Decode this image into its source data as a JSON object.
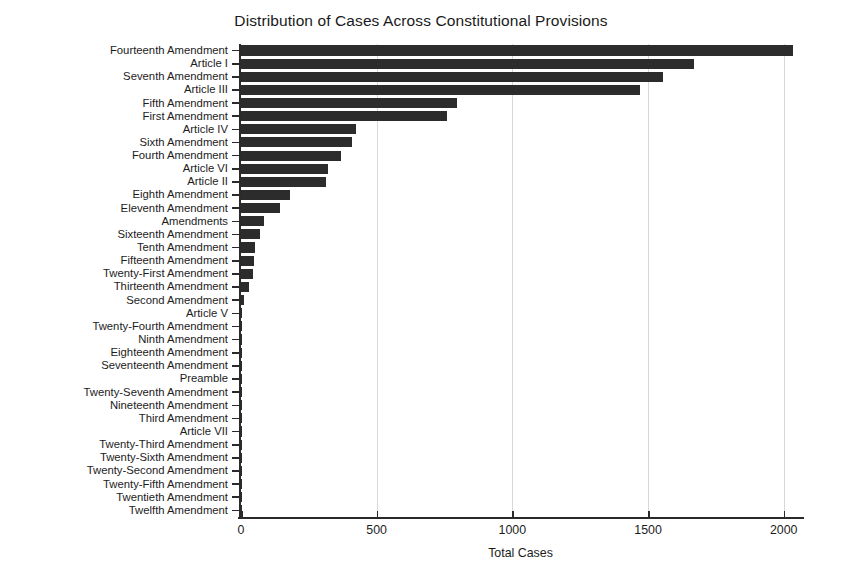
{
  "chart_data": {
    "type": "bar",
    "orientation": "horizontal",
    "title": "Distribution of Cases Across Constitutional Provisions",
    "xlabel": "Total Cases",
    "ylabel": "",
    "xlim": [
      0,
      2060
    ],
    "ylim": null,
    "grid": "vertical light gridlines",
    "legend": null,
    "bar_color": "#2c2c2c",
    "background_color": "#ffffff",
    "xticks": [
      0,
      500,
      1000,
      1500,
      2000
    ],
    "xtick_labels": [
      "0",
      "500",
      "1000",
      "1500",
      "2000"
    ],
    "categories": [
      "Fourteenth Amendment",
      "Article I",
      "Seventh Amendment",
      "Article III",
      "Fifth Amendment",
      "First Amendment",
      "Article IV",
      "Sixth Amendment",
      "Fourth Amendment",
      "Article VI",
      "Article II",
      "Eighth Amendment",
      "Eleventh Amendment",
      "Amendments",
      "Sixteenth Amendment",
      "Tenth Amendment",
      "Fifteenth Amendment",
      "Twenty-First Amendment",
      "Thirteenth Amendment",
      "Second Amendment",
      "Article V",
      "Twenty-Fourth Amendment",
      "Ninth Amendment",
      "Eighteenth Amendment",
      "Seventeenth Amendment",
      "Preamble",
      "Twenty-Seventh Amendment",
      "Nineteenth Amendment",
      "Third Amendment",
      "Article VII",
      "Twenty-Third Amendment",
      "Twenty-Sixth Amendment",
      "Twenty-Second Amendment",
      "Twenty-Fifth Amendment",
      "Twentieth Amendment",
      "Twelfth Amendment"
    ],
    "values": [
      2035,
      1670,
      1555,
      1470,
      795,
      760,
      425,
      410,
      370,
      320,
      315,
      182,
      145,
      85,
      70,
      52,
      48,
      44,
      29,
      12,
      4,
      3,
      3,
      3,
      3,
      2,
      2,
      2,
      2,
      1,
      1,
      1,
      1,
      1,
      1,
      1
    ]
  }
}
